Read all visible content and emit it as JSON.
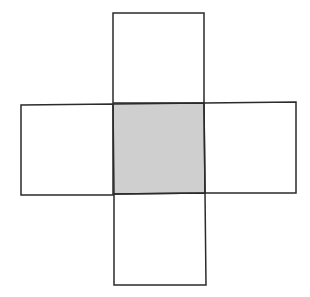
{
  "diagram": {
    "stroke_color": "#2b2b2b",
    "shaded_fill": "#cfcfcf",
    "empty_fill": "#ffffff",
    "squares": [
      {
        "name": "top",
        "points": "113,13 204,13 204,103 113,103",
        "shaded": false
      },
      {
        "name": "left",
        "points": "21,105 113,104 113,195 21,195",
        "shaded": false
      },
      {
        "name": "center",
        "points": "113,104 204,103 205,193 114,194",
        "shaded": true
      },
      {
        "name": "right",
        "points": "204,103 296,102 296,193 205,193",
        "shaded": false
      },
      {
        "name": "bottom",
        "points": "114,194 205,193 206,285 114,285",
        "shaded": false
      }
    ]
  }
}
